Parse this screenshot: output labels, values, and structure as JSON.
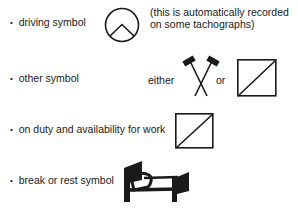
{
  "rows": [
    {
      "label": "driving symbol",
      "icon": "driving-circle-icon",
      "note_line1": "(this is automatically recorded",
      "note_line2": "on some tachographs)"
    },
    {
      "label": "other symbol",
      "either_text": "either",
      "icon_a": "crossed-hammers-icon",
      "or_text": "or",
      "icon_b": "square-diagonal-icon"
    },
    {
      "label": "on duty and availability for work",
      "icon": "square-diagonal-icon"
    },
    {
      "label": "break or rest symbol",
      "icon": "bed-icon"
    }
  ],
  "colors": {
    "ink": "#1a1a1a",
    "background": "#ffffff"
  }
}
